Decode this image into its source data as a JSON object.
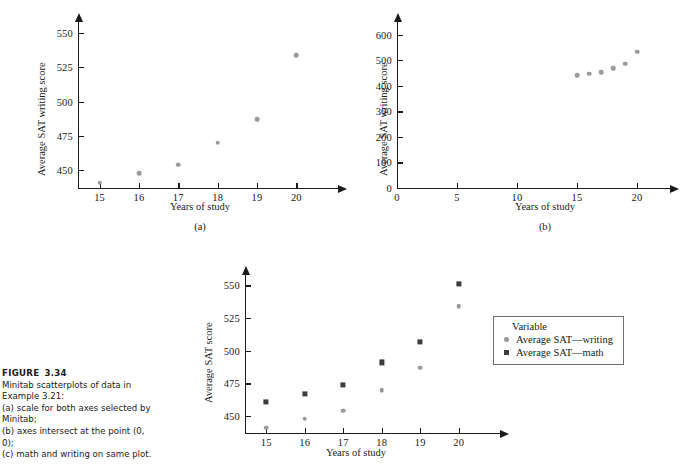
{
  "figure": {
    "label": "FIGURE",
    "number": "3.34",
    "caption_lines": [
      "Minitab scatterplots of data in",
      "Example 3.21:",
      "(a) scale for both axes selected by",
      "Minitab;",
      "(b) axes intersect at the point (0, 0);",
      "(c) math and writing on same plot."
    ]
  },
  "colors": {
    "writing_marker": "#9a9a9a",
    "math_marker": "#3c3c3c",
    "axis": "#1a1a1a",
    "legend_border": "#6e6e6e"
  },
  "chart_data": [
    {
      "id": "panel-a",
      "type": "scatter",
      "panel_label": "(a)",
      "title": "",
      "xlabel": "Years of study",
      "ylabel": "Average SAT writing score",
      "xlim": [
        14.45,
        20.55
      ],
      "ylim": [
        437,
        558
      ],
      "xticks": [
        15,
        16,
        17,
        18,
        19,
        20
      ],
      "yticks": [
        450,
        475,
        500,
        525,
        550
      ],
      "grid": false,
      "legend": "none",
      "series": [
        {
          "name": "Average SAT writing score",
          "marker": "circle",
          "color": "#9a9a9a",
          "x": [
            15,
            16,
            17,
            18,
            19,
            20
          ],
          "values": [
            441,
            448,
            454,
            470,
            487,
            534
          ]
        }
      ]
    },
    {
      "id": "panel-b",
      "type": "scatter",
      "panel_label": "(b)",
      "title": "",
      "xlabel": "Years of study",
      "ylabel": "Average SAT writing score",
      "xlim": [
        0,
        21.5
      ],
      "ylim": [
        0,
        650
      ],
      "xticks": [
        0,
        5,
        10,
        15,
        20
      ],
      "yticks": [
        0,
        100,
        200,
        300,
        400,
        500,
        600
      ],
      "grid": false,
      "legend": "none",
      "series": [
        {
          "name": "Average SAT writing score",
          "marker": "circle",
          "color": "#9a9a9a",
          "x": [
            15,
            16,
            17,
            18,
            19,
            20
          ],
          "values": [
            441,
            448,
            454,
            470,
            487,
            534
          ]
        }
      ]
    },
    {
      "id": "panel-c",
      "type": "scatter",
      "panel_label": "(c)",
      "title": "",
      "xlabel": "Years of study",
      "ylabel": "Average SAT score",
      "xlim": [
        14.45,
        20.55
      ],
      "ylim": [
        437,
        558
      ],
      "xticks": [
        15,
        16,
        17,
        18,
        19,
        20
      ],
      "yticks": [
        450,
        475,
        500,
        525,
        550
      ],
      "grid": false,
      "legend": "right",
      "legend_title": "Variable",
      "series": [
        {
          "name": "Average SAT—writing",
          "marker": "circle",
          "color": "#9a9a9a",
          "x": [
            15,
            16,
            17,
            18,
            19,
            20
          ],
          "values": [
            441,
            448,
            454,
            470,
            487,
            534
          ]
        },
        {
          "name": "Average SAT—math",
          "marker": "square",
          "color": "#3c3c3c",
          "x": [
            15,
            16,
            17,
            18,
            19,
            20
          ],
          "values": [
            461,
            467,
            474,
            491,
            507,
            551
          ]
        }
      ]
    }
  ]
}
